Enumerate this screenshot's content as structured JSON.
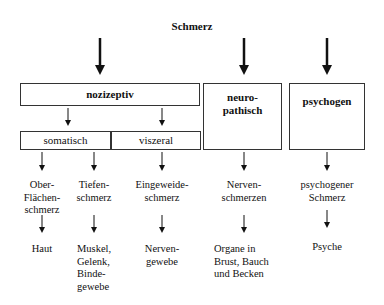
{
  "diagram": {
    "title": "Schmerz",
    "categories": [
      {
        "id": "nozizeptiv",
        "label": "nozizeptiv",
        "subcategories": [
          {
            "label": "somatisch",
            "types": [
              {
                "pain": "Ober-\nFlächen-\nschmerz",
                "tissue": "Haut"
              },
              {
                "pain": "Tiefen-\nschmerz",
                "tissue": "Muskel,\nGelenk,\nBinde-\ngewebe"
              }
            ]
          },
          {
            "label": "viszeral",
            "types": [
              {
                "pain": "Eingeweide-\nschmerz",
                "tissue": "Nerven-\ngewebe"
              }
            ]
          }
        ]
      },
      {
        "id": "neuropathisch",
        "label": "neuro-\npathisch",
        "types": [
          {
            "pain": "Nerven-\nschmerzen",
            "tissue": "Organe in\nBrust, Bauch\nund Becken"
          }
        ]
      },
      {
        "id": "psychogen",
        "label": "psychogen",
        "types": [
          {
            "pain": "psychogener\nSchmerz",
            "tissue": "Psyche"
          }
        ]
      }
    ]
  },
  "labels": {
    "title": "Schmerz",
    "nozizeptiv": "nozizeptiv",
    "somatisch": "somatisch",
    "viszeral": "viszeral",
    "neuro_line1": "neuro-",
    "neuro_line2": "pathisch",
    "psychogen": "psychogen",
    "oberflaechen_1": "Ober-",
    "oberflaechen_2": "Flächen-",
    "oberflaechen_3": "schmerz",
    "tiefen_1": "Tiefen-",
    "tiefen_2": "schmerz",
    "eingeweide_1": "Eingeweide-",
    "eingeweide_2": "schmerz",
    "nerven_1": "Nerven-",
    "nerven_2": "schmerzen",
    "psychogener_1": "psychogener",
    "psychogener_2": "Schmerz",
    "haut": "Haut",
    "muskel_1": "Muskel,",
    "muskel_2": "Gelenk,",
    "muskel_3": "Binde-",
    "muskel_4": "gewebe",
    "nervengewebe_1": "Nerven-",
    "nervengewebe_2": "gewebe",
    "organe_1": "Organe in",
    "organe_2": "Brust, Bauch",
    "organe_3": "und Becken",
    "psyche": "Psyche"
  },
  "colors": {
    "line": "#111111",
    "box_border": "#333333",
    "background": "#ffffff"
  }
}
